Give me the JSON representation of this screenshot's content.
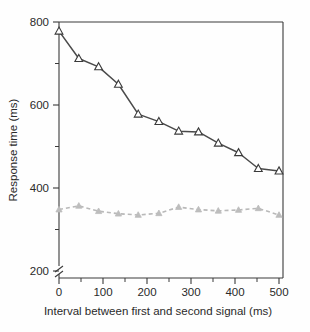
{
  "chart_data": {
    "type": "line",
    "title": "",
    "xlabel": "Interval between first and second signal (ms)",
    "ylabel": "Response time (ms)",
    "xlim": [
      0,
      500
    ],
    "ylim": [
      200,
      800
    ],
    "axis_break": true,
    "axis_break_note": "y-axis broken below 200",
    "grid": false,
    "legend": "none",
    "x": [
      0,
      45,
      90,
      135,
      180,
      227,
      272,
      317,
      362,
      408,
      453,
      500
    ],
    "xticks_major": [
      0,
      100,
      200,
      300,
      400,
      500
    ],
    "xticks_minor": [
      50,
      150,
      250,
      350,
      450
    ],
    "yticks_major": [
      200,
      400,
      600,
      800
    ],
    "yticks_minor": [
      300,
      500,
      700
    ],
    "series": [
      {
        "name": "dual-task response time",
        "marker": "open-triangle",
        "line_style": "solid",
        "color": "#4a4a4a",
        "values": [
          778,
          712,
          692,
          650,
          578,
          560,
          537,
          535,
          508,
          485,
          447,
          441
        ]
      },
      {
        "name": "single-task response time",
        "marker": "filled-triangle",
        "line_style": "dashed",
        "color": "#bdbdbd",
        "values": [
          348,
          357,
          344,
          338,
          335,
          339,
          354,
          348,
          345,
          347,
          351,
          335
        ]
      }
    ]
  },
  "axis": {
    "xtick_labels": [
      "0",
      "100",
      "200",
      "300",
      "400",
      "500"
    ],
    "ytick_labels": [
      "200",
      "400",
      "600",
      "800"
    ]
  }
}
